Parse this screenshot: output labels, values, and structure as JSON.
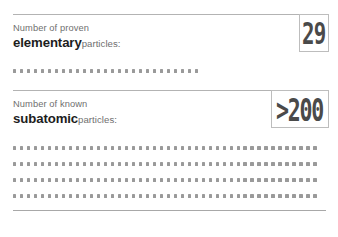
{
  "card": {
    "background_color": "#ffffff",
    "rule_color": "#b3b3b3",
    "dot_color": "#9a9a9a",
    "value_color": "#4a4a4a",
    "emphasis_color": "#1d1d1d",
    "muted_color": "#6f6f6f"
  },
  "sections": [
    {
      "label_line1": "Number of proven",
      "label_emphasis": "elementary",
      "label_tail": "particles:",
      "value": "29",
      "dot_rows": [
        27
      ]
    },
    {
      "label_line1": "Number of known",
      "label_emphasis": "subatomic",
      "label_tail": "particles:",
      "value": ">200",
      "dot_rows": [
        44,
        44,
        44,
        44
      ]
    }
  ]
}
